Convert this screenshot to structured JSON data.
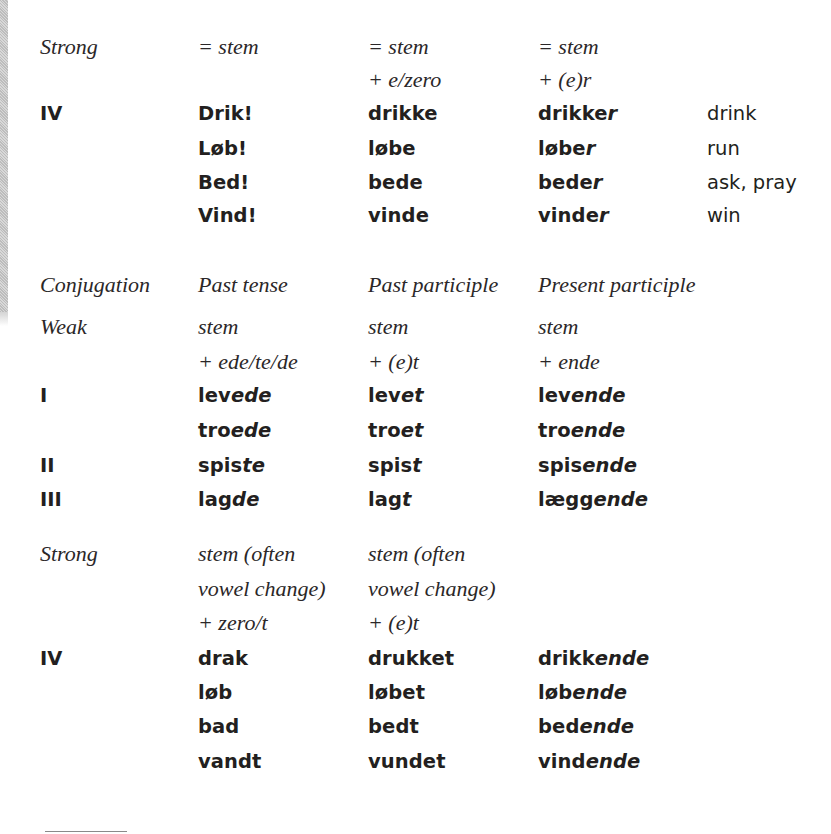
{
  "section_present": {
    "header": {
      "class_label": "Strong",
      "imperative_rule": "= stem",
      "infinitive_rule_line1": "= stem",
      "infinitive_rule_line2": "+ e/zero",
      "present_rule_line1": "= stem",
      "present_rule_line2": "+ (e)r"
    },
    "rows": [
      {
        "group": "IV",
        "imperative": "Drik!",
        "infinitive_stem": "drikk",
        "infinitive_suffix": "e",
        "present_stem": "drikke",
        "present_suffix": "r",
        "meaning": "drink"
      },
      {
        "group": "",
        "imperative": "Løb!",
        "infinitive_stem": "løb",
        "infinitive_suffix": "e",
        "present_stem": "løbe",
        "present_suffix": "r",
        "meaning": "run"
      },
      {
        "group": "",
        "imperative": "Bed!",
        "infinitive_stem": "bed",
        "infinitive_suffix": "e",
        "present_stem": "bede",
        "present_suffix": "r",
        "meaning": "ask, pray"
      },
      {
        "group": "",
        "imperative": "Vind!",
        "infinitive_stem": "vind",
        "infinitive_suffix": "e",
        "present_stem": "vinde",
        "present_suffix": "r",
        "meaning": "win"
      }
    ]
  },
  "section_past": {
    "column_headers": {
      "conjugation": "Conjugation",
      "past_tense": "Past tense",
      "past_participle": "Past participle",
      "present_participle": "Present participle"
    },
    "weak": {
      "class_label": "Weak",
      "past_tense_rule_line1": "stem",
      "past_tense_rule_line2": "+ ede/te/de",
      "past_participle_rule_line1": "stem",
      "past_participle_rule_line2": "+ (e)t",
      "present_participle_rule_line1": "stem",
      "present_participle_rule_line2": "+ ende",
      "rows": [
        {
          "group": "I",
          "past_stem": "lev",
          "past_suffix": "ede",
          "pp_stem": "lev",
          "pp_suffix": "et",
          "prp_stem": "lev",
          "prp_suffix": "ende"
        },
        {
          "group": "",
          "past_stem": "tro",
          "past_suffix": "ede",
          "pp_stem": "tro",
          "pp_suffix": "et",
          "prp_stem": "tro",
          "prp_suffix": "ende"
        },
        {
          "group": "II",
          "past_stem": "spis",
          "past_suffix": "te",
          "pp_stem": "spis",
          "pp_suffix": "t",
          "prp_stem": "spis",
          "prp_suffix": "ende"
        },
        {
          "group": "III",
          "past_stem": "lag",
          "past_suffix": "de",
          "pp_stem": "lag",
          "pp_suffix": "t",
          "prp_stem": "lægg",
          "prp_suffix": "ende"
        }
      ]
    },
    "strong": {
      "class_label": "Strong",
      "past_tense_rule_line1": "stem (often",
      "past_tense_rule_line2": "vowel change)",
      "past_tense_rule_line3": "+ zero/t",
      "past_participle_rule_line1": "stem (often",
      "past_participle_rule_line2": "vowel change)",
      "past_participle_rule_line3": "+ (e)t",
      "rows": [
        {
          "group": "IV",
          "past_stem": "drak",
          "past_suffix": "",
          "pp_stem": "drukk",
          "pp_suffix": "et",
          "prp_stem": "drikk",
          "prp_suffix": "ende"
        },
        {
          "group": "",
          "past_stem": "løb",
          "past_suffix": "",
          "pp_stem": "løb",
          "pp_suffix": "et",
          "prp_stem": "løb",
          "prp_suffix": "ende"
        },
        {
          "group": "",
          "past_stem": "bad",
          "past_suffix": "",
          "pp_stem": "bed",
          "pp_suffix": "t",
          "prp_stem": "bed",
          "prp_suffix": "ende"
        },
        {
          "group": "",
          "past_stem": "vandt",
          "past_suffix": "",
          "pp_stem": "vund",
          "pp_suffix": "et",
          "prp_stem": "vind",
          "prp_suffix": "ende"
        }
      ]
    }
  }
}
